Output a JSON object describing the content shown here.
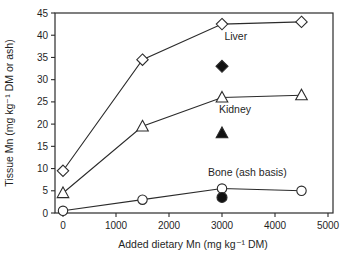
{
  "chart_data": {
    "type": "line",
    "title": "",
    "xlabel": "Added dietary Mn (mg kg⁻¹ DM)",
    "ylabel": "Tissue Mn (mg kg⁻¹ DM or ash)",
    "xlim": [
      0,
      5000
    ],
    "ylim": [
      0,
      45
    ],
    "x_ticks": [
      0,
      1000,
      2000,
      3000,
      4000,
      5000
    ],
    "y_ticks": [
      0,
      5,
      10,
      15,
      20,
      25,
      30,
      35,
      40,
      45
    ],
    "grid": false,
    "legend_position": "inline-labels",
    "x": [
      0,
      1500,
      3000,
      4500
    ],
    "series": [
      {
        "id": "liver",
        "name": "Liver",
        "marker": "diamond",
        "values": [
          9.5,
          34.5,
          42.5,
          43
        ]
      },
      {
        "id": "kidney",
        "name": "Kidney",
        "marker": "triangle",
        "values": [
          4.5,
          19.5,
          26,
          26.5
        ]
      },
      {
        "id": "bone",
        "name": "Bone (ash basis)",
        "marker": "circle",
        "values": [
          0.5,
          3,
          5.5,
          5
        ]
      }
    ],
    "filled_points": [
      {
        "id": "diamond",
        "marker": "diamond",
        "x": 3000,
        "y": 33
      },
      {
        "id": "triangle",
        "marker": "triangle",
        "x": 3000,
        "y": 18
      },
      {
        "id": "circle",
        "marker": "circle",
        "x": 3000,
        "y": 3.5
      }
    ],
    "annotations": [
      {
        "id": "liver",
        "text": "Liver",
        "x": 3260,
        "y": 39.8
      },
      {
        "id": "kidney",
        "text": "Kidney",
        "x": 3245,
        "y": 23.3
      },
      {
        "id": "bone",
        "text": "Bone (ash basis)",
        "x": 3480,
        "y": 9.2
      }
    ],
    "colors": {
      "line": "#2b2b2b",
      "text": "#1f1f1f",
      "background": "#ffffff",
      "open_marker_fill": "#ffffff",
      "filled_marker_fill": "#111111"
    }
  }
}
